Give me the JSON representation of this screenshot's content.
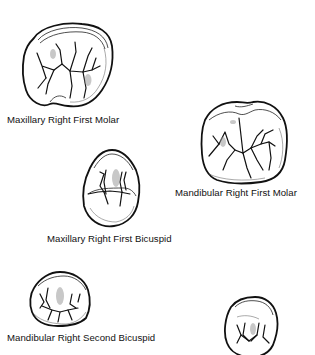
{
  "figure": {
    "teeth": [
      {
        "id": "max-r-first-molar",
        "label": "Maxillary Right First Molar"
      },
      {
        "id": "mand-r-first-molar",
        "label": "Mandibular Right First Molar"
      },
      {
        "id": "max-r-first-bicuspid",
        "label": "Maxillary Right First Bicuspid"
      },
      {
        "id": "mand-r-second-bicuspid",
        "label": "Mandibular Right Second Bicuspid"
      },
      {
        "id": "unlabeled-tooth-bottom-right",
        "label": ""
      }
    ],
    "colors": {
      "line": "#111111",
      "background": "#ffffff",
      "shading": "#9a9a9a"
    }
  }
}
